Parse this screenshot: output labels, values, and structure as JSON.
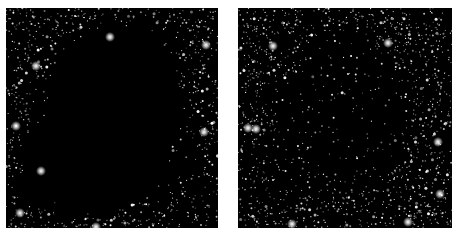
{
  "figure": {
    "background": "#ffffff",
    "panels": [
      {
        "name": "left-starfield-panel",
        "x": 6,
        "y": 8,
        "w": 212,
        "h": 220,
        "seed": 11,
        "star_count": 1700,
        "bright_stars": [
          [
            10,
            118
          ],
          [
            30,
            58
          ],
          [
            14,
            205
          ],
          [
            198,
            124
          ],
          [
            90,
            219
          ],
          [
            104,
            29
          ],
          [
            35,
            163
          ],
          [
            200,
            37
          ]
        ],
        "dark_blobs": [
          {
            "cx": 110,
            "cy": 95,
            "rx": 62,
            "ry": 75,
            "strength": 1.0
          },
          {
            "cx": 92,
            "cy": 150,
            "rx": 70,
            "ry": 50,
            "strength": 1.0
          },
          {
            "cx": 55,
            "cy": 178,
            "rx": 45,
            "ry": 22,
            "strength": 0.95
          },
          {
            "cx": 150,
            "cy": 150,
            "rx": 40,
            "ry": 40,
            "strength": 0.7
          }
        ]
      },
      {
        "name": "right-starfield-panel",
        "x": 238,
        "y": 8,
        "w": 214,
        "h": 220,
        "seed": 29,
        "star_count": 1900,
        "bright_stars": [
          [
            10,
            120
          ],
          [
            18,
            121
          ],
          [
            35,
            38
          ],
          [
            54,
            216
          ],
          [
            170,
            214
          ],
          [
            200,
            134
          ],
          [
            202,
            186
          ],
          [
            150,
            35
          ]
        ],
        "dark_blobs": [
          {
            "cx": 105,
            "cy": 105,
            "rx": 60,
            "ry": 70,
            "strength": 0.75
          },
          {
            "cx": 80,
            "cy": 150,
            "rx": 50,
            "ry": 35,
            "strength": 0.6
          }
        ]
      }
    ],
    "caption": ""
  }
}
